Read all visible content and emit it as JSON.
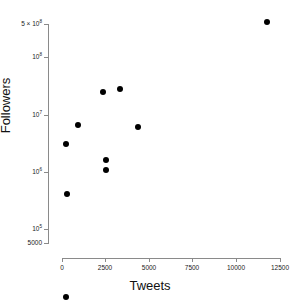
{
  "chart_data": {
    "type": "scatter",
    "title": "",
    "xlabel": "Tweets",
    "ylabel": "Followers",
    "xscale": "linear",
    "yscale": "log",
    "xlim": [
      0,
      12500
    ],
    "ylim": [
      5000,
      500000000
    ],
    "grid": false,
    "legend": null,
    "xticks": [
      0,
      2500,
      5000,
      7500,
      10000,
      12500
    ],
    "xticklabels": [
      "0",
      "2500",
      "5000",
      "7500",
      "10000",
      "12500"
    ],
    "yticks": [
      500000000,
      100000000,
      10000000,
      1000000,
      100000,
      5000
    ],
    "yticklabels": [
      "5 × 10⁸",
      "10⁸",
      "10⁷",
      "10⁶",
      "10⁵",
      "5000"
    ],
    "marker": "filled-circle",
    "marker_color": "#000000",
    "points": [
      {
        "x": 11750,
        "y": 400000000
      },
      {
        "x": 2350,
        "y": 25000000
      },
      {
        "x": 3300,
        "y": 28000000
      },
      {
        "x": 900,
        "y": 6500000
      },
      {
        "x": 4350,
        "y": 6000000
      },
      {
        "x": 250,
        "y": 3000000
      },
      {
        "x": 2550,
        "y": 1600000
      },
      {
        "x": 2500,
        "y": 1050000
      },
      {
        "x": 280,
        "y": 400000
      },
      {
        "x": 230,
        "y": 6500
      }
    ],
    "n_points": 10
  },
  "axes": {
    "y_tick_positions_px": [
      24,
      57,
      115,
      172,
      229,
      243
    ],
    "x_tick_positions_px": [
      62,
      105,
      149,
      192,
      236,
      280
    ]
  }
}
